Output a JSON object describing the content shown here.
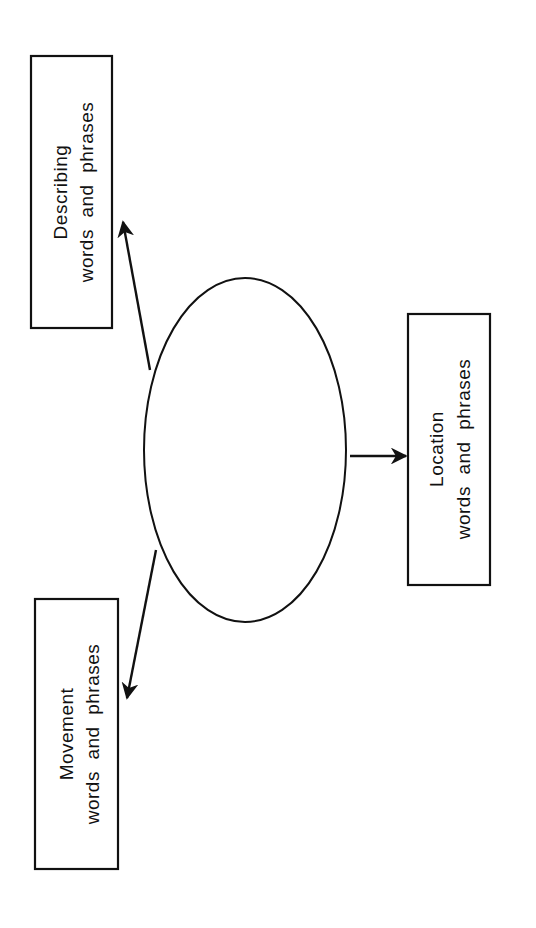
{
  "diagram": {
    "type": "web-graphic-organizer",
    "stroke_color": "#111111",
    "background": "#ffffff",
    "center": {
      "shape": "ellipse",
      "label": ""
    },
    "boxes": [
      {
        "id": "describing",
        "line1": "Describing",
        "line2": "words  and  phrases"
      },
      {
        "id": "location",
        "line1": "Location",
        "line2": "words  and  phrases"
      },
      {
        "id": "movement",
        "line1": "Movement",
        "line2": "words  and  phrases"
      }
    ],
    "arrows": [
      {
        "from": "center",
        "to": "describing"
      },
      {
        "from": "center",
        "to": "location"
      },
      {
        "from": "center",
        "to": "movement"
      }
    ]
  }
}
